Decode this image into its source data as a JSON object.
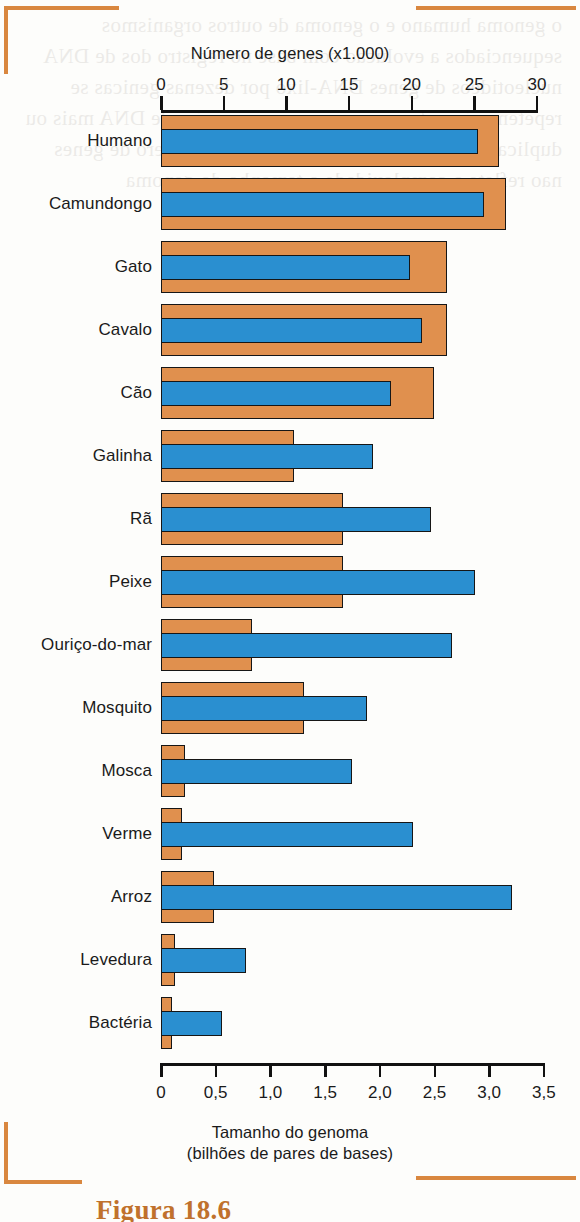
{
  "figure": {
    "caption": "Figura 18.6",
    "bracket_color": "#d9873f"
  },
  "colors": {
    "genes_bar": "#e0904e",
    "genome_bar": "#2a8fd0",
    "axis": "#111111",
    "accent": "#d9873f"
  },
  "bleed_text": "o genoma humano e o genoma de outros organismos sequenciados a evolucao com base no registro dos de DNA nucleotideos de genes DNA-lixo por dezenas genicas se repetem e invertem no numero e sequencias de DNA mais ou duplicados as vezes de um modo geral o numero de genes nao reflete a complexidade o tamanho do genoma",
  "chart_data": {
    "type": "bar",
    "orientation": "horizontal",
    "title": "",
    "grid": false,
    "legend": "none",
    "axes": {
      "top": {
        "label": "Número de genes (x1.000)",
        "ticks": [
          "0",
          "5",
          "10",
          "15",
          "20",
          "25",
          "30"
        ],
        "tick_values": [
          0,
          5,
          10,
          15,
          20,
          25,
          30
        ],
        "range": [
          0,
          30
        ],
        "series": "Número de genes (x1.000)"
      },
      "bottom": {
        "label_line1": "Tamanho do genoma",
        "label_line2": "(bilhões de pares de bases)",
        "ticks": [
          "0",
          "0,5",
          "1,0",
          "1,5",
          "2,0",
          "2,5",
          "3,0",
          "3,5"
        ],
        "tick_values": [
          0,
          0.5,
          1.0,
          1.5,
          2.0,
          2.5,
          3.0,
          3.5
        ],
        "range": [
          0,
          3.5
        ],
        "series": "Tamanho do genoma (bilhões de pares de bases)"
      }
    },
    "categories": [
      "Humano",
      "Camundongo",
      "Gato",
      "Cavalo",
      "Cão",
      "Galinha",
      "Rã",
      "Peixe",
      "Ouriço-do-mar",
      "Mosquito",
      "Mosca",
      "Verme",
      "Arroz",
      "Levedura",
      "Bactéria"
    ],
    "series": [
      {
        "name": "Número de genes (x1.000)",
        "axis": "top",
        "color": "#e0904e",
        "values": [
          27.0,
          27.5,
          22.8,
          22.8,
          21.8,
          10.6,
          14.5,
          14.5,
          7.3,
          11.4,
          1.9,
          1.7,
          4.2,
          1.1,
          0.9
        ]
      },
      {
        "name": "Tamanho do genoma (bilhões de pares de bases)",
        "axis": "bottom",
        "color": "#2a8fd0",
        "values": [
          2.9,
          2.95,
          2.28,
          2.39,
          2.1,
          1.94,
          2.47,
          2.87,
          2.66,
          1.88,
          1.75,
          2.3,
          3.21,
          0.78,
          0.56
        ]
      }
    ]
  }
}
